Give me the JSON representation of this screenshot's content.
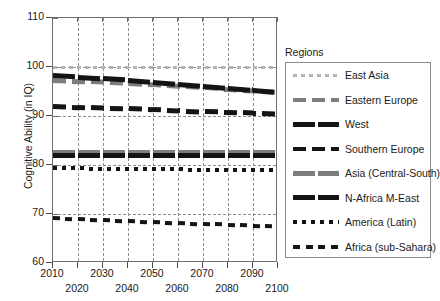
{
  "chart_data": {
    "type": "line",
    "title": "",
    "xlabel": "",
    "ylabel": "Cognitive Ability (in IQ)",
    "xlim": [
      2010,
      2100
    ],
    "ylim": [
      60,
      110
    ],
    "yticks": [
      60,
      70,
      80,
      90,
      100,
      110
    ],
    "xticks": [
      2010,
      2020,
      2030,
      2040,
      2050,
      2060,
      2070,
      2080,
      2090,
      2100
    ],
    "xticklabels_top_row": [
      "2010",
      "2030",
      "2050",
      "2070",
      "2090"
    ],
    "xticklabels_bottom_row": [
      "2020",
      "2040",
      "2060",
      "2080",
      "2100"
    ],
    "grid": true,
    "grid_style": "dashed",
    "legend_position": "right",
    "legend_title": "Regions",
    "x": [
      2010,
      2020,
      2030,
      2040,
      2050,
      2060,
      2070,
      2080,
      2090,
      2100
    ],
    "series": [
      {
        "name": "East Asia",
        "color": "#b4b4b4",
        "style": "dotted-fine",
        "values": [
          100.0,
          100.0,
          100.0,
          100.0,
          100.0,
          100.0,
          100.0,
          100.0,
          100.0,
          100.0
        ]
      },
      {
        "name": "Eastern Europe",
        "color": "#7d7d7d",
        "style": "dashed-thick",
        "values": [
          97.3,
          97.1,
          96.9,
          96.7,
          96.4,
          96.1,
          95.8,
          95.5,
          95.2,
          94.9
        ]
      },
      {
        "name": "West",
        "color": "#141414",
        "style": "solid-thick",
        "values": [
          98.2,
          97.9,
          97.6,
          97.3,
          96.9,
          96.5,
          96.1,
          95.7,
          95.3,
          94.9
        ]
      },
      {
        "name": "Southern Europe",
        "color": "#141414",
        "style": "dashed-thick",
        "values": [
          92.0,
          91.8,
          91.6,
          91.5,
          91.3,
          91.1,
          90.9,
          90.8,
          90.6,
          90.4
        ]
      },
      {
        "name": "Asia (Central-South)",
        "color": "#7d7d7d",
        "style": "solid-thick",
        "values": [
          82.5,
          82.5,
          82.5,
          82.5,
          82.5,
          82.5,
          82.5,
          82.5,
          82.5,
          82.5
        ]
      },
      {
        "name": "N-Africa M-East",
        "color": "#141414",
        "style": "solid-thick",
        "values": [
          81.9,
          81.9,
          81.9,
          81.9,
          81.9,
          81.9,
          81.9,
          81.9,
          81.9,
          81.9
        ]
      },
      {
        "name": "America (Latin)",
        "color": "#141414",
        "style": "dotted-square",
        "values": [
          79.3,
          79.3,
          79.2,
          79.2,
          79.1,
          79.1,
          79.0,
          79.0,
          78.9,
          78.9
        ]
      },
      {
        "name": "Africa (sub-Sahara)",
        "color": "#141414",
        "style": "dashed-short",
        "values": [
          69.2,
          69.0,
          68.8,
          68.6,
          68.4,
          68.2,
          68.0,
          67.9,
          67.7,
          67.5
        ]
      }
    ]
  },
  "legend": {
    "title": "Regions",
    "items": [
      {
        "label": "East Asia"
      },
      {
        "label": "Eastern Europe"
      },
      {
        "label": "West"
      },
      {
        "label": "Southern Europe"
      },
      {
        "label": "Asia (Central-South)"
      },
      {
        "label": "N-Africa M-East"
      },
      {
        "label": "America (Latin)"
      },
      {
        "label": "Africa (sub-Sahara)"
      }
    ]
  },
  "axes": {
    "y_title": "Cognitive Ability (in IQ)",
    "y_labels": [
      "110",
      "100",
      "90",
      "80",
      "70",
      "60"
    ],
    "x_labels_row1": [
      "2010",
      "2030",
      "2050",
      "2070",
      "2090"
    ],
    "x_labels_row2": [
      "2020",
      "2040",
      "2060",
      "2080",
      "2100"
    ]
  }
}
